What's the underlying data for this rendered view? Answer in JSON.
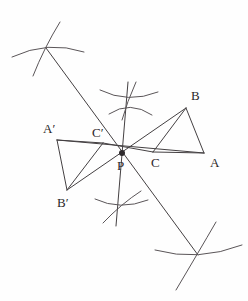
{
  "figure": {
    "background_color": "#fefefe",
    "line_color": "#444042",
    "arc_color": "#5a5558",
    "label_color": "#2b2729",
    "width": 248,
    "height": 301
  },
  "chart_data": {
    "type": "diagram",
    "points": [
      {
        "name": "A",
        "label": "A",
        "x": 204,
        "y": 153,
        "label_x": 210,
        "label_y": 164
      },
      {
        "name": "B",
        "label": "B",
        "x": 186,
        "y": 108,
        "label_x": 191,
        "label_y": 97
      },
      {
        "name": "C",
        "label": "C",
        "x": 153,
        "y": 152,
        "label_x": 151,
        "label_y": 164
      },
      {
        "name": "P",
        "label": "P",
        "x": 122,
        "y": 153,
        "label_x": 117,
        "label_y": 167
      },
      {
        "name": "A'",
        "label": "A′",
        "x": 57,
        "y": 140,
        "label_x": 43,
        "label_y": 130
      },
      {
        "name": "B'",
        "label": "B′",
        "x": 67,
        "y": 190,
        "label_x": 57,
        "label_y": 204
      },
      {
        "name": "C'",
        "label": "C′",
        "x": 103,
        "y": 143,
        "label_x": 92,
        "label_y": 134
      }
    ],
    "segments": [
      {
        "name": "side-AB",
        "from": [
          186,
          108
        ],
        "to": [
          204,
          153
        ]
      },
      {
        "name": "side-BC",
        "from": [
          186,
          108
        ],
        "to": [
          153,
          152
        ]
      },
      {
        "name": "side-CA",
        "from": [
          153,
          152
        ],
        "to": [
          204,
          153
        ]
      },
      {
        "name": "side-ApBp",
        "from": [
          57,
          140
        ],
        "to": [
          67,
          190
        ]
      },
      {
        "name": "side-BpCp",
        "from": [
          67,
          190
        ],
        "to": [
          103,
          143
        ]
      },
      {
        "name": "side-CpAp",
        "from": [
          103,
          143
        ],
        "to": [
          57,
          140
        ]
      },
      {
        "name": "ray-A-to-Aprime",
        "from": [
          204,
          153
        ],
        "to": [
          57,
          140
        ]
      },
      {
        "name": "ray-B-to-Bprime",
        "from": [
          186,
          108
        ],
        "to": [
          67,
          190
        ]
      },
      {
        "name": "ray-C-to-Cprime",
        "from": [
          153,
          152
        ],
        "to": [
          103,
          143
        ]
      },
      {
        "name": "construction-diagonal",
        "from": [
          46,
          48
        ],
        "to": [
          198,
          255
        ]
      },
      {
        "name": "construction-vertical",
        "from": [
          128,
          82
        ],
        "to": [
          116,
          226
        ]
      }
    ],
    "arc_clusters": [
      {
        "name": "arc-cluster-upper-left",
        "cx": 46,
        "cy": 48
      },
      {
        "name": "arc-cluster-upper-middle",
        "cx": 128,
        "cy": 100
      },
      {
        "name": "arc-cluster-lower-middle",
        "cx": 120,
        "cy": 205
      },
      {
        "name": "arc-cluster-lower-right",
        "cx": 198,
        "cy": 255
      }
    ],
    "arcs": [
      {
        "name": "arc-ul-1",
        "d": "M 12,57 Q 48,40 84,52"
      },
      {
        "name": "arc-ul-2",
        "d": "M 60,22 Q 44,48 33,76"
      },
      {
        "name": "arc-um-1",
        "d": "M 100,90 Q 128,104 158,92"
      },
      {
        "name": "arc-um-2",
        "d": "M 109,114 Q 130,100 152,115"
      },
      {
        "name": "arc-um-3",
        "d": "M 136,82 Q 127,102 122,120"
      },
      {
        "name": "arc-lm-1",
        "d": "M 95,199 Q 120,211 148,200"
      },
      {
        "name": "arc-lm-2",
        "d": "M 103,223 Q 121,204 141,191"
      },
      {
        "name": "arc-lr-1",
        "d": "M 155,250 Q 198,262 242,245"
      },
      {
        "name": "arc-lr-2",
        "d": "M 176,290 Q 198,253 216,222"
      }
    ],
    "notes": {
      "centre": "P",
      "relation": "Triangle A'B'C' is the image of triangle ABC under a half-turn about P"
    }
  }
}
